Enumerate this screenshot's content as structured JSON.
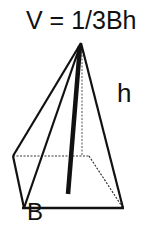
{
  "diagram": {
    "formula": "V = 1/3Bh",
    "labels": {
      "height": "h",
      "base": "B"
    },
    "colors": {
      "line": "#111111",
      "background": "#ffffff"
    }
  }
}
